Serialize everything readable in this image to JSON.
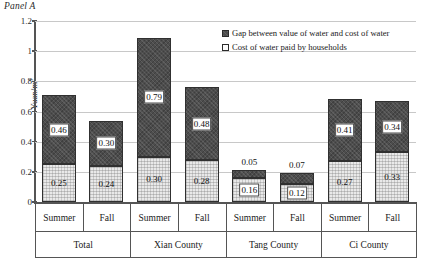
{
  "panel": {
    "title": "Panel A"
  },
  "legend": {
    "position": "top-right",
    "items": [
      {
        "id": "gap",
        "label": "Gap between value of water and cost of water",
        "swatch": "dark-filled-square",
        "color": "#4d4d4d"
      },
      {
        "id": "cost",
        "label": "Cost of water paid by households",
        "swatch": "light-outlined-square",
        "color": "#ededed"
      }
    ]
  },
  "chart_data": {
    "type": "bar",
    "stacked": true,
    "title": "Panel A",
    "xlabel": "",
    "ylabel": "Yuan/m3",
    "ylabel_html": "Yuan/m<sup>3</sup>",
    "ylim": [
      0,
      1.2
    ],
    "yticks": [
      "0",
      "0.2",
      "0.4",
      "0.6",
      "0.8",
      "1",
      "1.2"
    ],
    "ytick_values": [
      0,
      0.2,
      0.4,
      0.6,
      0.8,
      1,
      1.2
    ],
    "grid": true,
    "grid_axis": "y",
    "categories": [
      "Summer",
      "Fall",
      "Summer",
      "Fall",
      "Summer",
      "Fall",
      "Summer",
      "Fall"
    ],
    "groups": [
      {
        "name": "Total",
        "span": 2
      },
      {
        "name": "Xian County",
        "span": 2
      },
      {
        "name": "Tang County",
        "span": 2
      },
      {
        "name": "Ci County",
        "span": 2
      }
    ],
    "series": [
      {
        "name": "Cost of water paid by households",
        "values": [
          0.25,
          0.24,
          0.3,
          0.28,
          0.16,
          0.12,
          0.27,
          0.33
        ]
      },
      {
        "name": "Gap between value of water and cost of water",
        "values": [
          0.46,
          0.3,
          0.79,
          0.48,
          0.05,
          0.07,
          0.41,
          0.34
        ]
      }
    ],
    "totals": [
      0.71,
      0.54,
      1.09,
      0.76,
      0.21,
      0.19,
      0.68,
      0.67
    ]
  },
  "bars": [
    {
      "group": "Total",
      "season": "Summer",
      "cost": "0.25",
      "gap": "0.46",
      "cost_value": 0.25,
      "gap_value": 0.46,
      "gap_label_outside": false
    },
    {
      "group": "Total",
      "season": "Fall",
      "cost": "0.24",
      "gap": "0.30",
      "cost_value": 0.24,
      "gap_value": 0.3,
      "gap_label_outside": false
    },
    {
      "group": "Xian County",
      "season": "Summer",
      "cost": "0.30",
      "gap": "0.79",
      "cost_value": 0.3,
      "gap_value": 0.79,
      "gap_label_outside": false
    },
    {
      "group": "Xian County",
      "season": "Fall",
      "cost": "0.28",
      "gap": "0.48",
      "cost_value": 0.28,
      "gap_value": 0.48,
      "gap_label_outside": false
    },
    {
      "group": "Tang County",
      "season": "Summer",
      "cost": "0.16",
      "gap": "0.05",
      "cost_value": 0.16,
      "gap_value": 0.05,
      "gap_label_outside": true
    },
    {
      "group": "Tang County",
      "season": "Fall",
      "cost": "0.12",
      "gap": "0.07",
      "cost_value": 0.12,
      "gap_value": 0.07,
      "gap_label_outside": true
    },
    {
      "group": "Ci County",
      "season": "Summer",
      "cost": "0.27",
      "gap": "0.41",
      "cost_value": 0.27,
      "gap_value": 0.41,
      "gap_label_outside": false
    },
    {
      "group": "Ci County",
      "season": "Fall",
      "cost": "0.33",
      "gap": "0.34",
      "cost_value": 0.33,
      "gap_value": 0.34,
      "gap_label_outside": false
    }
  ]
}
